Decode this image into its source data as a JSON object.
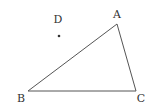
{
  "diagram": {
    "type": "geometry-triangle",
    "stroke_color": "#555555",
    "label_color": "#333333",
    "points": {
      "A": {
        "label": "A",
        "x": 117,
        "y": 24,
        "label_x": 117,
        "label_y": 18
      },
      "B": {
        "label": "B",
        "x": 28,
        "y": 91,
        "label_x": 21,
        "label_y": 102
      },
      "C": {
        "label": "C",
        "x": 136,
        "y": 91,
        "label_x": 141,
        "label_y": 102
      },
      "D": {
        "label": "D",
        "x": 59,
        "y": 36,
        "label_x": 58,
        "label_y": 23
      }
    },
    "segments": [
      {
        "from": "A",
        "to": "B"
      },
      {
        "from": "B",
        "to": "C"
      },
      {
        "from": "C",
        "to": "A"
      }
    ],
    "isolated_points": [
      "D"
    ]
  }
}
